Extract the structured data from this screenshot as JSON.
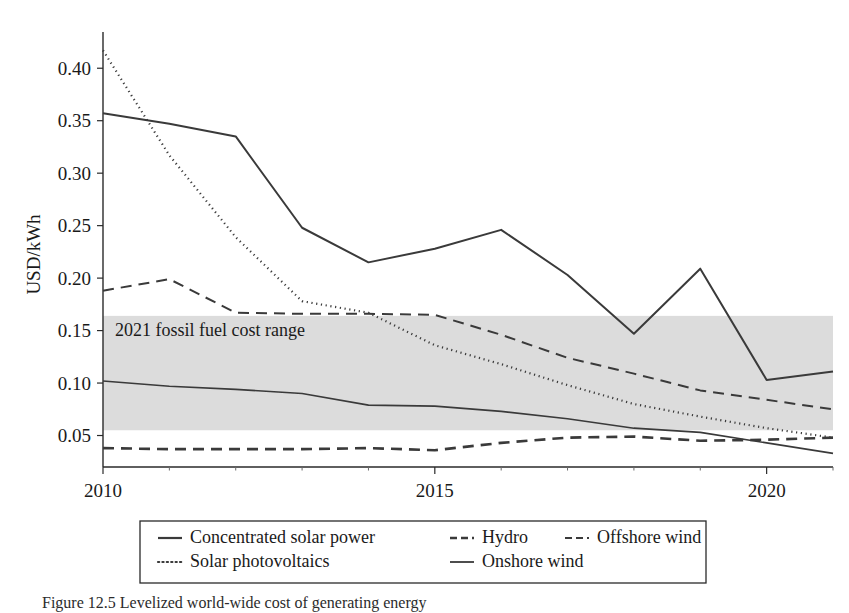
{
  "figure": {
    "caption": "Figure 12.5  Levelized world-wide cost of generating energy",
    "background_color": "#ffffff"
  },
  "chart_data": {
    "type": "line",
    "title": "",
    "xlabel": "",
    "ylabel": "USD/kWh",
    "xlim": [
      2010,
      2021
    ],
    "ylim": [
      0.02,
      0.425
    ],
    "grid": false,
    "legend_position": "bottom-outside",
    "x": [
      2010,
      2011,
      2012,
      2013,
      2014,
      2015,
      2016,
      2017,
      2018,
      2019,
      2020,
      2021
    ],
    "xticks": [
      2010,
      2015,
      2020
    ],
    "xtick_labels": [
      "2010",
      "2015",
      "2020"
    ],
    "xticks_minor": [
      2011,
      2012,
      2013,
      2014,
      2016,
      2017,
      2018,
      2019,
      2021
    ],
    "yticks": [
      0.05,
      0.1,
      0.15,
      0.2,
      0.25,
      0.3,
      0.35,
      0.4
    ],
    "ytick_labels": [
      "0.05",
      "0.10",
      "0.15",
      "0.20",
      "0.25",
      "0.30",
      "0.35",
      "0.40"
    ],
    "series": [
      {
        "name": "Concentrated solar power",
        "style": "solid",
        "color": "#2e2e2e",
        "width": 2.0,
        "values": [
          0.357,
          0.347,
          0.335,
          0.248,
          0.215,
          0.228,
          0.246,
          0.203,
          0.147,
          0.209,
          0.103,
          0.111
        ]
      },
      {
        "name": "Solar photovoltaics",
        "style": "dotted",
        "color": "#3a3a3a",
        "width": 2.2,
        "values": [
          0.417,
          0.317,
          0.239,
          0.178,
          0.167,
          0.136,
          0.118,
          0.098,
          0.08,
          0.068,
          0.057,
          0.048
        ]
      },
      {
        "name": "Offshore wind",
        "style": "dashed",
        "color": "#555555",
        "width": 2.0,
        "values": [
          0.188,
          0.199,
          0.167,
          0.166,
          0.166,
          0.165,
          0.146,
          0.124,
          0.109,
          0.093,
          0.084,
          0.075
        ]
      },
      {
        "name": "Onshore wind",
        "style": "solid",
        "color": "#4a4a4a",
        "width": 1.6,
        "values": [
          0.102,
          0.097,
          0.094,
          0.09,
          0.079,
          0.078,
          0.073,
          0.066,
          0.057,
          0.053,
          0.043,
          0.033
        ]
      },
      {
        "name": "Hydro",
        "style": "dashed-heavy",
        "color": "#2e2e2e",
        "width": 2.6,
        "values": [
          0.038,
          0.037,
          0.037,
          0.037,
          0.038,
          0.036,
          0.043,
          0.048,
          0.049,
          0.045,
          0.046,
          0.048
        ]
      }
    ],
    "shaded_bands": [
      {
        "label": "2021 fossil fuel cost range",
        "y_min": 0.055,
        "y_max": 0.164,
        "color": "#dcdcdc",
        "label_y": 0.151
      }
    ]
  },
  "legend": {
    "entries": [
      {
        "label": "Concentrated solar power",
        "style": "solid"
      },
      {
        "label": "Hydro",
        "style": "dashed-heavy"
      },
      {
        "label": "Offshore wind",
        "style": "dashed"
      },
      {
        "label": "Solar photovoltaics",
        "style": "dotted"
      },
      {
        "label": "Onshore wind",
        "style": "solid-thin"
      }
    ]
  }
}
